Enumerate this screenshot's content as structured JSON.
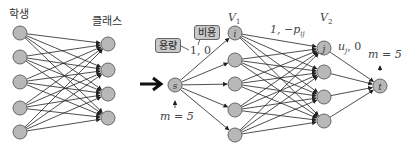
{
  "left": {
    "title_students": "학생",
    "title_classes": "클래스",
    "students": [
      {
        "y": 33
      },
      {
        "y": 57
      },
      {
        "y": 82
      },
      {
        "y": 108
      },
      {
        "y": 132
      }
    ],
    "classes": [
      {
        "y": 44
      },
      {
        "y": 70
      },
      {
        "y": 94
      },
      {
        "y": 118
      }
    ]
  },
  "arrow": {
    "label": "→"
  },
  "network": {
    "source": {
      "label": "s",
      "supply": "m = 5"
    },
    "sink": {
      "label": "t",
      "demand": "m = 5"
    },
    "v1": {
      "label": "V",
      "sub": "1",
      "first_node_label": "i",
      "ys": [
        33,
        60,
        84,
        110,
        135
      ]
    },
    "v2": {
      "label": "V",
      "sub": "2",
      "first_node_label": "j",
      "ys": [
        48,
        72,
        97,
        121
      ]
    },
    "edge_label_sv": "1, 0",
    "edge_label_v1v2": "1, −p",
    "edge_label_v1v2_sub": "ij",
    "edge_label_v2t": "u",
    "edge_label_v2t_sub": "j",
    "edge_label_v2t_suffix": ", 0",
    "callout_cost": "비용",
    "callout_capacity": "용량"
  },
  "colors": {
    "node_fill": "#b8b8b8",
    "node_stroke": "#666666",
    "edge": "#222222"
  }
}
